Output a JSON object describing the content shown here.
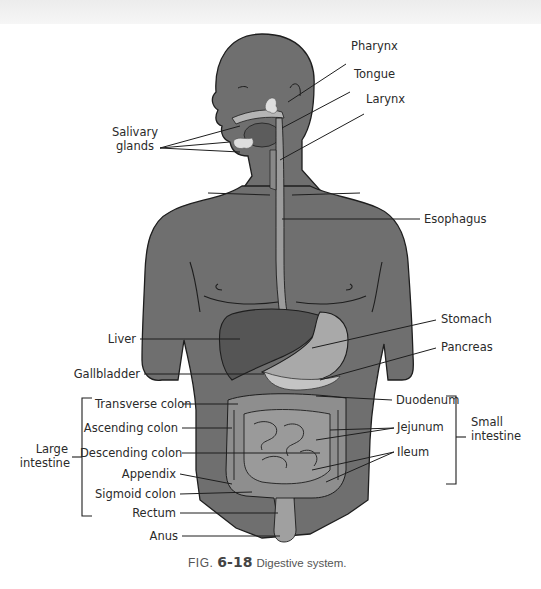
{
  "figure": {
    "number_prefix": "FIG.",
    "number": "6-18",
    "caption": "Digestive system."
  },
  "labels": {
    "pharynx": "Pharynx",
    "tongue": "Tongue",
    "larynx": "Larynx",
    "salivary_glands_line1": "Salivary",
    "salivary_glands_line2": "glands",
    "esophagus": "Esophagus",
    "liver": "Liver",
    "stomach": "Stomach",
    "pancreas": "Pancreas",
    "gallbladder": "Gallbladder",
    "transverse_colon": "Transverse colon",
    "ascending_colon": "Ascending colon",
    "descending_colon": "Descending colon",
    "appendix": "Appendix",
    "sigmoid_colon": "Sigmoid colon",
    "rectum": "Rectum",
    "anus": "Anus",
    "duodenum": "Duodenum",
    "jejunum": "Jejunum",
    "ileum": "Ileum",
    "large_intestine_line1": "Large",
    "large_intestine_line2": "intestine",
    "small_intestine_line1": "Small",
    "small_intestine_line2": "intestine"
  },
  "colors": {
    "body": "#6f6f6f",
    "liver": "#555555",
    "stomach": "#a9a9a9",
    "esophagus": "#9c9c9c",
    "intestine": "#8e8e8e",
    "pancreas": "#c4c4c4",
    "outline": "#1e1e1e"
  }
}
